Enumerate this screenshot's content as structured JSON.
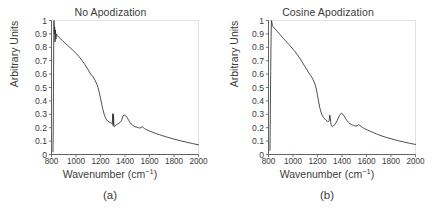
{
  "figure": {
    "panels": [
      {
        "id": "a",
        "caption": "(a)",
        "title": "No Apodization",
        "xlabel_main": "Wavenumber (cm",
        "xlabel_sup": "−1",
        "xlabel_close": ")",
        "ylabel": "Arbitrary Units"
      },
      {
        "id": "b",
        "caption": "(b)",
        "title": "Cosine Apodization",
        "xlabel_main": "Wavenumber (cm",
        "xlabel_sup": "−1",
        "xlabel_close": ")",
        "ylabel": "Arbitrary Units"
      }
    ]
  },
  "chart_data": [
    {
      "type": "line",
      "panel": "a",
      "title": "No Apodization",
      "xlabel": "Wavenumber (cm-1)",
      "ylabel": "Arbitrary Units",
      "xlim": [
        800,
        2000
      ],
      "ylim": [
        0,
        1
      ],
      "xticks": [
        800,
        1000,
        1200,
        1400,
        1600,
        1800,
        2000
      ],
      "xtick_labels": [
        "800",
        "1000",
        "1200",
        "1400",
        "1600",
        "1800",
        "2000"
      ],
      "yticks": [
        0,
        0.1,
        0.2,
        0.3,
        0.4,
        0.5,
        0.6,
        0.7,
        0.8,
        0.9,
        1
      ],
      "ytick_labels": [
        "0",
        "0.1",
        "0.2",
        "0.3",
        "0.4",
        "0.5",
        "0.6",
        "0.7",
        "0.8",
        "0.9",
        "1"
      ],
      "grid": false,
      "legend": "none",
      "line_color": "#2f2f2f",
      "x": [
        812,
        814,
        816,
        818,
        820,
        823,
        826,
        829,
        832,
        836,
        840,
        845,
        850,
        860,
        875,
        890,
        910,
        930,
        950,
        975,
        1000,
        1025,
        1050,
        1075,
        1100,
        1120,
        1140,
        1155,
        1170,
        1180,
        1190,
        1200,
        1210,
        1220,
        1230,
        1240,
        1250,
        1260,
        1270,
        1280,
        1290,
        1296,
        1300,
        1303,
        1306,
        1310,
        1313,
        1316,
        1320,
        1330,
        1340,
        1350,
        1360,
        1370,
        1378,
        1385,
        1392,
        1400,
        1410,
        1420,
        1430,
        1440,
        1450,
        1460,
        1470,
        1480,
        1490,
        1500,
        1510,
        1520,
        1530,
        1540,
        1550,
        1560,
        1570,
        1580,
        1600,
        1620,
        1650,
        1680,
        1700,
        1750,
        1800,
        1850,
        1900,
        1950,
        2000
      ],
      "y": [
        0.02,
        0.18,
        0.47,
        0.78,
        1.0,
        0.9,
        0.95,
        0.84,
        0.93,
        0.86,
        0.9,
        0.89,
        0.885,
        0.875,
        0.862,
        0.85,
        0.832,
        0.815,
        0.798,
        0.778,
        0.755,
        0.73,
        0.7,
        0.668,
        0.63,
        0.6,
        0.578,
        0.555,
        0.525,
        0.5,
        0.462,
        0.42,
        0.375,
        0.335,
        0.3,
        0.275,
        0.258,
        0.248,
        0.242,
        0.238,
        0.233,
        0.228,
        0.305,
        0.215,
        0.3,
        0.212,
        0.205,
        0.21,
        0.215,
        0.222,
        0.228,
        0.232,
        0.24,
        0.252,
        0.27,
        0.288,
        0.295,
        0.292,
        0.285,
        0.272,
        0.255,
        0.24,
        0.228,
        0.22,
        0.213,
        0.208,
        0.205,
        0.203,
        0.2,
        0.198,
        0.2,
        0.207,
        0.2,
        0.193,
        0.188,
        0.183,
        0.175,
        0.168,
        0.157,
        0.148,
        0.142,
        0.128,
        0.115,
        0.103,
        0.092,
        0.082,
        0.072
      ]
    },
    {
      "type": "line",
      "panel": "b",
      "title": "Cosine Apodization",
      "xlabel": "Wavenumber (cm-1)",
      "ylabel": "Arbitrary Units",
      "xlim": [
        800,
        2000
      ],
      "ylim": [
        0,
        1
      ],
      "xticks": [
        800,
        1000,
        1200,
        1400,
        1600,
        1800,
        2000
      ],
      "xtick_labels": [
        "800",
        "1000",
        "1200",
        "1400",
        "1600",
        "1800",
        "2000"
      ],
      "yticks": [
        0,
        0.1,
        0.2,
        0.3,
        0.4,
        0.5,
        0.6,
        0.7,
        0.8,
        0.9,
        1
      ],
      "ytick_labels": [
        "0",
        "0.1",
        "0.2",
        "0.3",
        "0.4",
        "0.5",
        "0.6",
        "0.7",
        "0.8",
        "0.9",
        "1"
      ],
      "grid": false,
      "legend": "none",
      "line_color": "#2f2f2f",
      "x": [
        812,
        815,
        818,
        821,
        824,
        828,
        832,
        838,
        845,
        852,
        860,
        870,
        885,
        900,
        920,
        940,
        960,
        985,
        1010,
        1035,
        1060,
        1085,
        1105,
        1125,
        1145,
        1160,
        1172,
        1182,
        1192,
        1200,
        1210,
        1220,
        1230,
        1240,
        1250,
        1260,
        1270,
        1280,
        1288,
        1295,
        1300,
        1305,
        1310,
        1316,
        1322,
        1330,
        1340,
        1350,
        1360,
        1370,
        1380,
        1390,
        1398,
        1405,
        1415,
        1425,
        1435,
        1445,
        1455,
        1465,
        1475,
        1485,
        1495,
        1505,
        1515,
        1525,
        1535,
        1545,
        1555,
        1565,
        1575,
        1590,
        1610,
        1630,
        1660,
        1690,
        1720,
        1760,
        1800,
        1850,
        1900,
        1950,
        2000
      ],
      "y": [
        0.03,
        0.3,
        0.62,
        0.87,
        1.0,
        0.985,
        0.96,
        0.955,
        0.945,
        0.938,
        0.93,
        0.92,
        0.905,
        0.888,
        0.868,
        0.848,
        0.828,
        0.802,
        0.775,
        0.745,
        0.712,
        0.675,
        0.645,
        0.615,
        0.59,
        0.565,
        0.542,
        0.518,
        0.482,
        0.44,
        0.39,
        0.345,
        0.312,
        0.29,
        0.275,
        0.265,
        0.255,
        0.248,
        0.245,
        0.25,
        0.295,
        0.27,
        0.225,
        0.212,
        0.208,
        0.212,
        0.222,
        0.235,
        0.252,
        0.272,
        0.292,
        0.305,
        0.308,
        0.302,
        0.29,
        0.275,
        0.26,
        0.248,
        0.238,
        0.23,
        0.224,
        0.22,
        0.217,
        0.214,
        0.212,
        0.215,
        0.222,
        0.218,
        0.21,
        0.203,
        0.197,
        0.19,
        0.182,
        0.173,
        0.162,
        0.15,
        0.14,
        0.128,
        0.118,
        0.105,
        0.094,
        0.084,
        0.075
      ]
    }
  ]
}
